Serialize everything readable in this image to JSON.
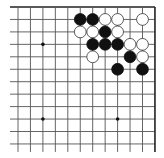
{
  "board": {
    "section": "top-right corner",
    "columns": 12,
    "rows": 12,
    "colors": {
      "background": "#ffffff",
      "line": "#555555",
      "black": "#111111",
      "white": "#ffffff"
    },
    "star_points": [
      {
        "col": 2,
        "row": 3
      },
      {
        "col": 2,
        "row": 9
      },
      {
        "col": 8,
        "row": 9
      }
    ],
    "stones": [
      {
        "color": "black",
        "col": 5,
        "row": 1
      },
      {
        "color": "black",
        "col": 6,
        "row": 1
      },
      {
        "color": "white",
        "col": 7,
        "row": 1
      },
      {
        "color": "white",
        "col": 8,
        "row": 1
      },
      {
        "color": "white",
        "col": 10,
        "row": 1
      },
      {
        "color": "white",
        "col": 5,
        "row": 2
      },
      {
        "color": "white",
        "col": 6,
        "row": 2
      },
      {
        "color": "black",
        "col": 7,
        "row": 2
      },
      {
        "color": "white",
        "col": 8,
        "row": 2
      },
      {
        "color": "black",
        "col": 6,
        "row": 3
      },
      {
        "color": "black",
        "col": 7,
        "row": 3
      },
      {
        "color": "black",
        "col": 8,
        "row": 3
      },
      {
        "color": "white",
        "col": 9,
        "row": 3
      },
      {
        "color": "white",
        "col": 10,
        "row": 3
      },
      {
        "color": "white",
        "col": 6,
        "row": 4
      },
      {
        "color": "black",
        "col": 9,
        "row": 4
      },
      {
        "color": "white",
        "col": 10,
        "row": 4
      },
      {
        "color": "black",
        "col": 8,
        "row": 5
      },
      {
        "color": "black",
        "col": 10,
        "row": 5
      }
    ]
  }
}
